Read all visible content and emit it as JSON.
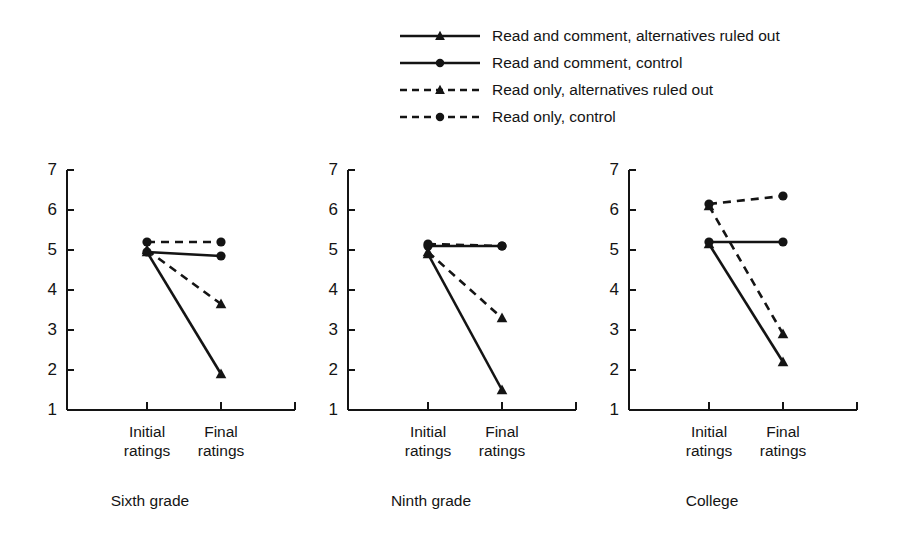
{
  "chart_data": {
    "type": "line",
    "title": "",
    "xlabel": "",
    "ylabel": "",
    "ylim": [
      1,
      7
    ],
    "yticks": [
      1,
      2,
      3,
      4,
      5,
      6,
      7
    ],
    "grid": false,
    "legend_position": "top-center",
    "x": [
      "Initial ratings",
      "Final ratings"
    ],
    "panels": [
      {
        "title": "Sixth grade",
        "series": [
          {
            "name": "Read and comment, alternatives ruled out",
            "values": [
              4.95,
              1.9
            ]
          },
          {
            "name": "Read and comment, control",
            "values": [
              4.95,
              4.85
            ]
          },
          {
            "name": "Read only, alternatives ruled out",
            "values": [
              5.0,
              3.65
            ]
          },
          {
            "name": "Read only, control",
            "values": [
              5.2,
              5.2
            ]
          }
        ]
      },
      {
        "title": "Ninth grade",
        "series": [
          {
            "name": "Read and comment, alternatives ruled out",
            "values": [
              4.9,
              1.5
            ]
          },
          {
            "name": "Read and comment, control",
            "values": [
              5.1,
              5.1
            ]
          },
          {
            "name": "Read only, alternatives ruled out",
            "values": [
              4.95,
              3.3
            ]
          },
          {
            "name": "Read only, control",
            "values": [
              5.15,
              5.1
            ]
          }
        ]
      },
      {
        "title": "College",
        "series": [
          {
            "name": "Read and comment, alternatives ruled out",
            "values": [
              5.15,
              2.2
            ]
          },
          {
            "name": "Read and comment, control",
            "values": [
              5.2,
              5.2
            ]
          },
          {
            "name": "Read only, alternatives ruled out",
            "values": [
              6.1,
              2.9
            ]
          },
          {
            "name": "Read only, control",
            "values": [
              6.15,
              6.35
            ]
          }
        ]
      }
    ],
    "legend": [
      {
        "label": "Read and comment, alternatives ruled out",
        "marker": "triangle",
        "line": "solid"
      },
      {
        "label": "Read and comment, control",
        "marker": "circle",
        "line": "solid"
      },
      {
        "label": "Read only, alternatives ruled out",
        "marker": "triangle",
        "line": "dashed"
      },
      {
        "label": "Read only, control",
        "marker": "circle",
        "line": "dashed"
      }
    ],
    "colors": {
      "ink": "#141414",
      "background": "#ffffff"
    }
  }
}
